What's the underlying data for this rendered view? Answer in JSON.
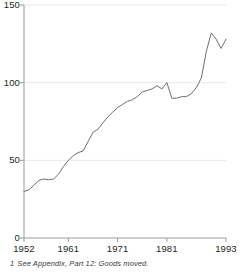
{
  "chart_data": {
    "type": "line",
    "title": "",
    "subtitle": "",
    "xlabel": "",
    "ylabel": "",
    "xlim": [
      1952,
      1993
    ],
    "ylim": [
      0,
      150
    ],
    "grid": true,
    "legend": null,
    "y_ticks": [
      "0",
      "50",
      "100",
      "150"
    ],
    "y_tick_values": [
      0,
      50,
      100,
      150
    ],
    "x_ticks": [
      "1952",
      "1961",
      "1971",
      "1981",
      "1993"
    ],
    "x_tick_values": [
      1952,
      1961,
      1971,
      1981,
      1993
    ],
    "series": [
      {
        "name": "Goods moved",
        "color": "#6e6e6e",
        "x": [
          1952,
          1953,
          1954,
          1955,
          1956,
          1957,
          1958,
          1959,
          1960,
          1961,
          1962,
          1963,
          1964,
          1965,
          1966,
          1967,
          1968,
          1969,
          1970,
          1971,
          1972,
          1973,
          1974,
          1975,
          1976,
          1977,
          1978,
          1979,
          1980,
          1981,
          1982,
          1983,
          1984,
          1985,
          1986,
          1987,
          1988,
          1989,
          1990,
          1991,
          1992,
          1993
        ],
        "values": [
          30,
          31,
          34,
          37,
          38,
          37.5,
          38,
          41,
          46,
          50,
          53,
          55,
          56,
          62,
          68,
          70,
          74,
          78,
          81,
          84,
          86,
          88,
          89,
          91,
          94,
          95,
          96,
          98,
          96,
          100,
          90,
          90,
          91,
          91,
          93,
          97,
          103,
          120,
          132,
          128,
          122,
          128
        ]
      }
    ],
    "annotations": []
  },
  "footnote": {
    "marker": "1",
    "text": "See Appendix, Part 12: Goods moved."
  }
}
